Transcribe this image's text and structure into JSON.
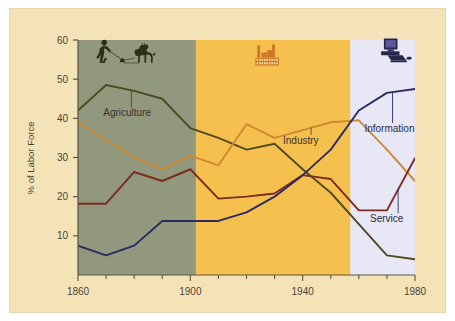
{
  "figure": {
    "background_color": "#f5e3b8",
    "page_color": "#ffffff"
  },
  "chart_data": {
    "type": "line",
    "title": "",
    "xlabel": "",
    "ylabel": "% of Labor Force",
    "xlim": [
      1860,
      1980
    ],
    "ylim": [
      0,
      60
    ],
    "grid": false,
    "legend_position": "inline-annotations",
    "xticks": [
      1860,
      1900,
      1940,
      1980
    ],
    "xtick_labels": [
      "1860",
      "1900",
      "1940",
      "1980"
    ],
    "xminor_step": 10,
    "yticks": [
      10,
      20,
      30,
      40,
      50,
      60
    ],
    "ytick_labels": [
      "10",
      "20",
      "30",
      "40",
      "50",
      "60"
    ],
    "x": [
      1860,
      1870,
      1880,
      1890,
      1900,
      1910,
      1920,
      1930,
      1940,
      1950,
      1960,
      1970,
      1980
    ],
    "series": [
      {
        "name": "Agriculture",
        "color": "#4f4a20",
        "values": [
          42,
          48.5,
          47,
          45,
          37.5,
          35,
          32,
          33.5,
          27,
          21,
          13,
          5,
          4
        ]
      },
      {
        "name": "Industry",
        "color": "#cc8a33",
        "values": [
          39,
          34.5,
          30,
          27,
          30.5,
          28,
          38.5,
          35,
          37,
          39,
          39.5,
          32,
          24
        ]
      },
      {
        "name": "Service",
        "color": "#7b2b20",
        "values": [
          18.2,
          18.2,
          26.3,
          24,
          27,
          19.5,
          20,
          20.8,
          25.5,
          24.5,
          16.5,
          16.5,
          29.8
        ]
      },
      {
        "name": "Information",
        "color": "#2b2b63",
        "values": [
          7.5,
          5,
          7.5,
          13.8,
          13.8,
          13.8,
          16,
          20,
          25.5,
          32,
          42,
          46.5,
          47.5
        ]
      }
    ],
    "bands": [
      {
        "name": "agricultural-era",
        "x_start": 1860,
        "x_end": 1902,
        "color": "#91987e",
        "icon": "farmer-plow-horse-icon",
        "icon_color": "#2f2e14"
      },
      {
        "name": "industrial-era",
        "x_start": 1902,
        "x_end": 1957,
        "color": "#f5c04e",
        "icon": "factory-icon",
        "icon_color": "#cc7722"
      },
      {
        "name": "information-era",
        "x_start": 1957,
        "x_end": 1980,
        "color": "#e7e7f5",
        "icon": "computer-icon",
        "icon_color": "#26264f"
      }
    ],
    "annotations": [
      {
        "label": "Agriculture",
        "x": 1869,
        "y": 40.5,
        "anchor": "start"
      },
      {
        "label": "Industry",
        "x": 1933,
        "y": 33.5,
        "anchor": "start"
      },
      {
        "label": "Information",
        "x": 1962,
        "y": 36.5,
        "anchor": "start"
      },
      {
        "label": "Service",
        "x": 1964,
        "y": 13.5,
        "anchor": "start"
      }
    ]
  }
}
